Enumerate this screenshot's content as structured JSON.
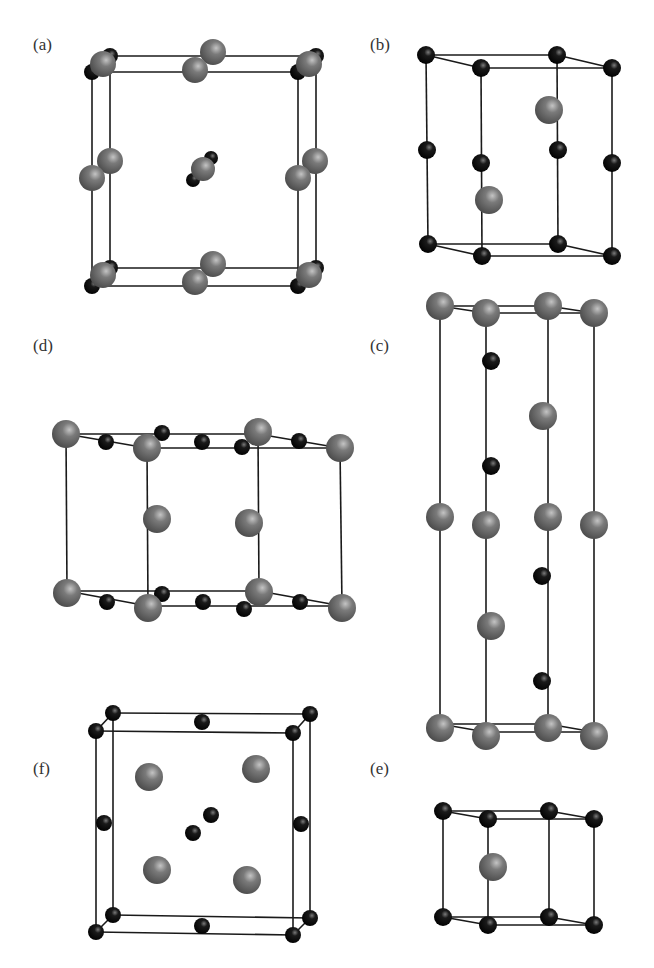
{
  "figure": {
    "colors": {
      "large_atom": "#6e6e6e",
      "large_atom_hi": "#b0b0b0",
      "small_atom": "#0d0d0d",
      "small_atom_hi": "#6a6a6a",
      "line": "#1a1a1a"
    },
    "panels": [
      {
        "id": "a",
        "label": "(a)",
        "label_pos": [
          33,
          52
        ],
        "lines": [
          [
            110,
            56,
            316,
            56
          ],
          [
            92,
            72,
            298,
            72
          ],
          [
            92,
            286,
            298,
            286
          ],
          [
            110,
            268,
            316,
            268
          ],
          [
            92,
            72,
            92,
            286
          ],
          [
            110,
            56,
            110,
            268
          ],
          [
            298,
            72,
            298,
            286
          ],
          [
            316,
            56,
            316,
            268
          ],
          [
            92,
            72,
            110,
            56
          ],
          [
            298,
            72,
            316,
            56
          ],
          [
            92,
            286,
            110,
            268
          ],
          [
            298,
            286,
            316,
            268
          ]
        ],
        "atoms": [
          {
            "x": 110,
            "y": 56,
            "r": 8,
            "t": "small"
          },
          {
            "x": 316,
            "y": 56,
            "r": 8,
            "t": "small"
          },
          {
            "x": 92,
            "y": 72,
            "r": 8,
            "t": "small"
          },
          {
            "x": 298,
            "y": 72,
            "r": 8,
            "t": "small"
          },
          {
            "x": 103,
            "y": 64,
            "r": 13,
            "t": "large"
          },
          {
            "x": 309,
            "y": 64,
            "r": 13,
            "t": "large"
          },
          {
            "x": 213,
            "y": 52,
            "r": 13,
            "t": "large"
          },
          {
            "x": 195,
            "y": 70,
            "r": 13,
            "t": "large"
          },
          {
            "x": 110,
            "y": 161,
            "r": 13,
            "t": "large"
          },
          {
            "x": 92,
            "y": 178,
            "r": 13,
            "t": "large"
          },
          {
            "x": 315,
            "y": 161,
            "r": 13,
            "t": "large"
          },
          {
            "x": 298,
            "y": 178,
            "r": 13,
            "t": "large"
          },
          {
            "x": 211,
            "y": 158,
            "r": 7,
            "t": "small"
          },
          {
            "x": 193,
            "y": 180,
            "r": 7,
            "t": "small"
          },
          {
            "x": 203,
            "y": 169,
            "r": 12,
            "t": "large"
          },
          {
            "x": 110,
            "y": 268,
            "r": 8,
            "t": "small"
          },
          {
            "x": 316,
            "y": 268,
            "r": 8,
            "t": "small"
          },
          {
            "x": 92,
            "y": 286,
            "r": 8,
            "t": "small"
          },
          {
            "x": 298,
            "y": 286,
            "r": 8,
            "t": "small"
          },
          {
            "x": 103,
            "y": 275,
            "r": 13,
            "t": "large"
          },
          {
            "x": 309,
            "y": 275,
            "r": 13,
            "t": "large"
          },
          {
            "x": 213,
            "y": 264,
            "r": 13,
            "t": "large"
          },
          {
            "x": 195,
            "y": 282,
            "r": 13,
            "t": "large"
          }
        ]
      },
      {
        "id": "b",
        "label": "(b)",
        "label_pos": [
          370,
          52
        ],
        "lines": [
          [
            426,
            55,
            557,
            55
          ],
          [
            426,
            55,
            481,
            68
          ],
          [
            481,
            68,
            612,
            68
          ],
          [
            557,
            55,
            612,
            68
          ],
          [
            428,
            244,
            558,
            244
          ],
          [
            428,
            244,
            482,
            256
          ],
          [
            482,
            256,
            612,
            256
          ],
          [
            558,
            244,
            612,
            256
          ],
          [
            426,
            55,
            428,
            244
          ],
          [
            481,
            68,
            482,
            256
          ],
          [
            557,
            55,
            558,
            244
          ],
          [
            612,
            68,
            612,
            256
          ]
        ],
        "atoms": [
          {
            "x": 426,
            "y": 55,
            "r": 9,
            "t": "small"
          },
          {
            "x": 557,
            "y": 55,
            "r": 9,
            "t": "small"
          },
          {
            "x": 481,
            "y": 68,
            "r": 9,
            "t": "small"
          },
          {
            "x": 612,
            "y": 68,
            "r": 9,
            "t": "small"
          },
          {
            "x": 549,
            "y": 110,
            "r": 14,
            "t": "large"
          },
          {
            "x": 427,
            "y": 150,
            "r": 9,
            "t": "small"
          },
          {
            "x": 558,
            "y": 150,
            "r": 9,
            "t": "small"
          },
          {
            "x": 481,
            "y": 163,
            "r": 9,
            "t": "small"
          },
          {
            "x": 612,
            "y": 163,
            "r": 9,
            "t": "small"
          },
          {
            "x": 489,
            "y": 200,
            "r": 14,
            "t": "large"
          },
          {
            "x": 428,
            "y": 244,
            "r": 9,
            "t": "small"
          },
          {
            "x": 558,
            "y": 244,
            "r": 9,
            "t": "small"
          },
          {
            "x": 482,
            "y": 256,
            "r": 9,
            "t": "small"
          },
          {
            "x": 612,
            "y": 256,
            "r": 9,
            "t": "small"
          }
        ]
      },
      {
        "id": "d",
        "label": "(d)",
        "label_pos": [
          33,
          353
        ],
        "lines": [
          [
            66,
            434,
            258,
            434
          ],
          [
            66,
            434,
            147,
            448
          ],
          [
            147,
            448,
            340,
            448
          ],
          [
            258,
            434,
            340,
            448
          ],
          [
            67,
            591,
            259,
            591
          ],
          [
            67,
            591,
            148,
            606
          ],
          [
            148,
            606,
            342,
            606
          ],
          [
            259,
            591,
            342,
            606
          ],
          [
            66,
            434,
            67,
            591
          ],
          [
            147,
            448,
            148,
            606
          ],
          [
            258,
            434,
            259,
            591
          ],
          [
            340,
            448,
            342,
            606
          ]
        ],
        "atoms": [
          {
            "x": 162,
            "y": 433,
            "r": 8,
            "t": "small"
          },
          {
            "x": 242,
            "y": 447,
            "r": 8,
            "t": "small"
          },
          {
            "x": 106,
            "y": 442,
            "r": 8,
            "t": "small"
          },
          {
            "x": 202,
            "y": 442,
            "r": 8,
            "t": "small"
          },
          {
            "x": 299,
            "y": 441,
            "r": 8,
            "t": "small"
          },
          {
            "x": 66,
            "y": 434,
            "r": 14,
            "t": "large"
          },
          {
            "x": 258,
            "y": 432,
            "r": 14,
            "t": "large"
          },
          {
            "x": 147,
            "y": 448,
            "r": 14,
            "t": "large"
          },
          {
            "x": 340,
            "y": 448,
            "r": 14,
            "t": "large"
          },
          {
            "x": 157,
            "y": 519,
            "r": 14,
            "t": "large"
          },
          {
            "x": 249,
            "y": 523,
            "r": 14,
            "t": "large"
          },
          {
            "x": 162,
            "y": 594,
            "r": 8,
            "t": "small"
          },
          {
            "x": 244,
            "y": 609,
            "r": 8,
            "t": "small"
          },
          {
            "x": 107,
            "y": 602,
            "r": 8,
            "t": "small"
          },
          {
            "x": 203,
            "y": 602,
            "r": 8,
            "t": "small"
          },
          {
            "x": 300,
            "y": 602,
            "r": 8,
            "t": "small"
          },
          {
            "x": 67,
            "y": 593,
            "r": 14,
            "t": "large"
          },
          {
            "x": 259,
            "y": 592,
            "r": 14,
            "t": "large"
          },
          {
            "x": 148,
            "y": 608,
            "r": 14,
            "t": "large"
          },
          {
            "x": 342,
            "y": 608,
            "r": 14,
            "t": "large"
          }
        ]
      },
      {
        "id": "c",
        "label": "(c)",
        "label_pos": [
          370,
          353
        ],
        "lines": [
          [
            440,
            306,
            548,
            306
          ],
          [
            440,
            306,
            486,
            313
          ],
          [
            486,
            313,
            594,
            313
          ],
          [
            548,
            306,
            594,
            313
          ],
          [
            440,
            724,
            548,
            724
          ],
          [
            440,
            724,
            486,
            732
          ],
          [
            486,
            732,
            594,
            732
          ],
          [
            548,
            724,
            594,
            732
          ],
          [
            440,
            306,
            440,
            724
          ],
          [
            486,
            313,
            486,
            732
          ],
          [
            548,
            306,
            548,
            724
          ],
          [
            594,
            313,
            594,
            732
          ]
        ],
        "atoms": [
          {
            "x": 440,
            "y": 306,
            "r": 14,
            "t": "large"
          },
          {
            "x": 548,
            "y": 306,
            "r": 14,
            "t": "large"
          },
          {
            "x": 486,
            "y": 313,
            "r": 14,
            "t": "large"
          },
          {
            "x": 594,
            "y": 313,
            "r": 14,
            "t": "large"
          },
          {
            "x": 491,
            "y": 361,
            "r": 9,
            "t": "small"
          },
          {
            "x": 543,
            "y": 416,
            "r": 14,
            "t": "large"
          },
          {
            "x": 491,
            "y": 466,
            "r": 9,
            "t": "small"
          },
          {
            "x": 440,
            "y": 517,
            "r": 14,
            "t": "large"
          },
          {
            "x": 548,
            "y": 517,
            "r": 14,
            "t": "large"
          },
          {
            "x": 486,
            "y": 525,
            "r": 14,
            "t": "large"
          },
          {
            "x": 594,
            "y": 525,
            "r": 14,
            "t": "large"
          },
          {
            "x": 542,
            "y": 576,
            "r": 9,
            "t": "small"
          },
          {
            "x": 491,
            "y": 626,
            "r": 14,
            "t": "large"
          },
          {
            "x": 542,
            "y": 681,
            "r": 9,
            "t": "small"
          },
          {
            "x": 440,
            "y": 728,
            "r": 14,
            "t": "large"
          },
          {
            "x": 548,
            "y": 728,
            "r": 14,
            "t": "large"
          },
          {
            "x": 486,
            "y": 736,
            "r": 14,
            "t": "large"
          },
          {
            "x": 594,
            "y": 736,
            "r": 14,
            "t": "large"
          }
        ]
      },
      {
        "id": "f",
        "label": "(f)",
        "label_pos": [
          33,
          776
        ],
        "lines": [
          [
            113,
            713,
            310,
            714
          ],
          [
            96,
            731,
            293,
            733
          ],
          [
            113,
            915,
            310,
            918
          ],
          [
            96,
            932,
            293,
            935
          ],
          [
            96,
            731,
            96,
            932
          ],
          [
            113,
            713,
            113,
            915
          ],
          [
            293,
            733,
            293,
            935
          ],
          [
            310,
            714,
            310,
            918
          ],
          [
            96,
            731,
            113,
            713
          ],
          [
            293,
            733,
            310,
            714
          ],
          [
            96,
            932,
            113,
            915
          ],
          [
            293,
            935,
            310,
            918
          ]
        ],
        "atoms": [
          {
            "x": 113,
            "y": 713,
            "r": 8,
            "t": "small"
          },
          {
            "x": 310,
            "y": 714,
            "r": 8,
            "t": "small"
          },
          {
            "x": 202,
            "y": 722,
            "r": 8,
            "t": "small"
          },
          {
            "x": 96,
            "y": 731,
            "r": 8,
            "t": "small"
          },
          {
            "x": 293,
            "y": 733,
            "r": 8,
            "t": "small"
          },
          {
            "x": 149,
            "y": 777,
            "r": 14,
            "t": "large"
          },
          {
            "x": 256,
            "y": 769,
            "r": 14,
            "t": "large"
          },
          {
            "x": 104,
            "y": 823,
            "r": 8,
            "t": "small"
          },
          {
            "x": 301,
            "y": 824,
            "r": 8,
            "t": "small"
          },
          {
            "x": 211,
            "y": 815,
            "r": 8,
            "t": "small"
          },
          {
            "x": 193,
            "y": 833,
            "r": 8,
            "t": "small"
          },
          {
            "x": 157,
            "y": 870,
            "r": 14,
            "t": "large"
          },
          {
            "x": 247,
            "y": 880,
            "r": 14,
            "t": "large"
          },
          {
            "x": 113,
            "y": 915,
            "r": 8,
            "t": "small"
          },
          {
            "x": 310,
            "y": 918,
            "r": 8,
            "t": "small"
          },
          {
            "x": 202,
            "y": 926,
            "r": 8,
            "t": "small"
          },
          {
            "x": 96,
            "y": 932,
            "r": 8,
            "t": "small"
          },
          {
            "x": 293,
            "y": 935,
            "r": 8,
            "t": "small"
          }
        ]
      },
      {
        "id": "e",
        "label": "(e)",
        "label_pos": [
          370,
          776
        ],
        "lines": [
          [
            443,
            811,
            549,
            811
          ],
          [
            443,
            811,
            488,
            819
          ],
          [
            488,
            819,
            594,
            819
          ],
          [
            549,
            811,
            594,
            819
          ],
          [
            443,
            917,
            549,
            917
          ],
          [
            443,
            917,
            488,
            925
          ],
          [
            488,
            925,
            594,
            925
          ],
          [
            549,
            917,
            594,
            925
          ],
          [
            443,
            811,
            443,
            917
          ],
          [
            488,
            819,
            488,
            925
          ],
          [
            549,
            811,
            549,
            917
          ],
          [
            594,
            819,
            594,
            925
          ]
        ],
        "atoms": [
          {
            "x": 443,
            "y": 811,
            "r": 9,
            "t": "small"
          },
          {
            "x": 549,
            "y": 811,
            "r": 9,
            "t": "small"
          },
          {
            "x": 488,
            "y": 819,
            "r": 9,
            "t": "small"
          },
          {
            "x": 594,
            "y": 819,
            "r": 9,
            "t": "small"
          },
          {
            "x": 493,
            "y": 867,
            "r": 14,
            "t": "large"
          },
          {
            "x": 443,
            "y": 917,
            "r": 9,
            "t": "small"
          },
          {
            "x": 549,
            "y": 917,
            "r": 9,
            "t": "small"
          },
          {
            "x": 488,
            "y": 925,
            "r": 9,
            "t": "small"
          },
          {
            "x": 594,
            "y": 925,
            "r": 9,
            "t": "small"
          }
        ]
      }
    ]
  }
}
